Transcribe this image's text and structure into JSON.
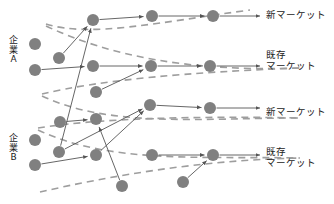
{
  "diagram": {
    "type": "network-flow",
    "title": "",
    "background_color": "#ffffff",
    "node_color": "#808080",
    "node_radius": 6,
    "arrow_color": "#555555",
    "dashed_color": "#9e9e9e",
    "text_color": "#1a1a1a",
    "left_labels": [
      {
        "id": "company-a",
        "text": "企\n業\nA",
        "x": 8,
        "y": 36
      },
      {
        "id": "company-b",
        "text": "企\n業\nB",
        "x": 8,
        "y": 134
      }
    ],
    "right_labels": [
      {
        "id": "new-market-top",
        "text": "新マーケット",
        "x": 266,
        "y": 9
      },
      {
        "id": "existing-market-top",
        "text": "既存\nマーケット",
        "x": 266,
        "y": 49
      },
      {
        "id": "new-market-bottom",
        "text": "新マーケット",
        "x": 266,
        "y": 106
      },
      {
        "id": "existing-market-bottom",
        "text": "既存\nマーケット",
        "x": 266,
        "y": 146
      }
    ],
    "nodes": [
      {
        "id": "n1",
        "x": 35,
        "y": 44
      },
      {
        "id": "n2",
        "x": 35,
        "y": 70
      },
      {
        "id": "n3",
        "x": 59,
        "y": 58
      },
      {
        "id": "n4",
        "x": 93,
        "y": 20
      },
      {
        "id": "n5",
        "x": 93,
        "y": 66
      },
      {
        "id": "n6",
        "x": 96,
        "y": 92
      },
      {
        "id": "n7",
        "x": 152,
        "y": 16
      },
      {
        "id": "n8",
        "x": 151,
        "y": 66
      },
      {
        "id": "n9",
        "x": 150,
        "y": 105
      },
      {
        "id": "n10",
        "x": 213,
        "y": 16
      },
      {
        "id": "n11",
        "x": 210,
        "y": 66
      },
      {
        "id": "n12",
        "x": 210,
        "y": 108
      },
      {
        "id": "n13",
        "x": 35,
        "y": 140
      },
      {
        "id": "n14",
        "x": 35,
        "y": 165
      },
      {
        "id": "n15",
        "x": 59,
        "y": 152
      },
      {
        "id": "n16",
        "x": 60,
        "y": 122
      },
      {
        "id": "n17",
        "x": 96,
        "y": 119
      },
      {
        "id": "n18",
        "x": 96,
        "y": 155
      },
      {
        "id": "n19",
        "x": 122,
        "y": 186
      },
      {
        "id": "n20",
        "x": 152,
        "y": 155
      },
      {
        "id": "n21",
        "x": 183,
        "y": 182
      },
      {
        "id": "n22",
        "x": 213,
        "y": 155
      }
    ],
    "solid_arrows": [
      {
        "from": "n3",
        "to": "n4"
      },
      {
        "from": "n2",
        "to": "n5"
      },
      {
        "from": "n4",
        "to": "n7"
      },
      {
        "from": "n5",
        "to": "n8"
      },
      {
        "from": "n6",
        "to": "n8"
      },
      {
        "from": "n7",
        "to": "n10"
      },
      {
        "from": "n8",
        "to": "n11"
      },
      {
        "from": "n16",
        "to": "n17"
      },
      {
        "from": "n15",
        "to": "n4"
      },
      {
        "from": "n15",
        "to": "n9"
      },
      {
        "from": "n14",
        "to": "n18"
      },
      {
        "from": "n18",
        "to": "n9"
      },
      {
        "from": "n9",
        "to": "n12"
      },
      {
        "from": "n19",
        "to": "n17"
      },
      {
        "from": "n21",
        "to": "n22"
      },
      {
        "from": "n20",
        "to": "n22"
      }
    ],
    "terminal_arrows": [
      {
        "from": "n10",
        "to_label": "new-market-top"
      },
      {
        "from": "n11",
        "to_label": "existing-market-top"
      },
      {
        "from": "n12",
        "to_label": "new-market-bottom"
      },
      {
        "from": "n22",
        "to_label": "existing-market-bottom"
      }
    ],
    "dashed_curves": [
      {
        "id": "band-1-upper",
        "d": "M 46 24 C 90 38 160 22 250 10"
      },
      {
        "id": "band-1-lower",
        "d": "M 46 26 C 110 56 190 72 300 68"
      },
      {
        "id": "band-2-upper",
        "d": "M 42 94 C 100 80 190 72 300 68"
      },
      {
        "id": "band-2-lower",
        "d": "M 42 96 C 110 128 200 118 300 118"
      },
      {
        "id": "band-3-upper",
        "d": "M 38 128 C 100 118 200 116 300 118"
      },
      {
        "id": "band-3-lower",
        "d": "M 38 130 C 110 164 200 156 300 158"
      },
      {
        "id": "band-4-upper",
        "d": "M 40 192 C 110 176 200 160 300 158"
      }
    ]
  }
}
